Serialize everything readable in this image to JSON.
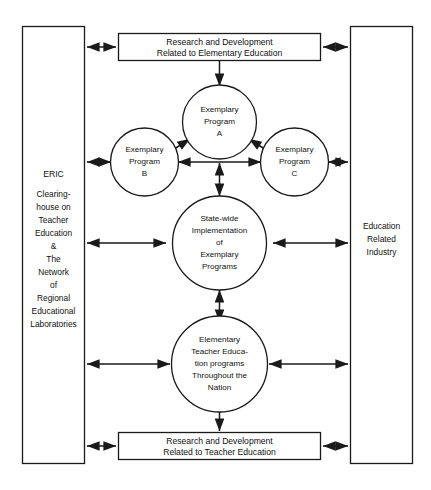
{
  "diagram": {
    "colors": {
      "background": "#ffffff",
      "stroke": "#1a1a1a",
      "text": "#111111",
      "fill": "#ffffff"
    },
    "left_panel": {
      "name": "eric-clearinghouse-panel",
      "lines": [
        "ERIC",
        "",
        "Clearing-",
        "house on",
        "Teacher",
        "Education",
        "&",
        "The",
        "Network",
        "of",
        "Regional",
        "Educational",
        "Laboratories"
      ]
    },
    "right_panel": {
      "name": "education-related-industry-panel",
      "lines": [
        "Education",
        "Related",
        "Industry"
      ]
    },
    "top_box": {
      "name": "research-development-elementary-education",
      "lines": [
        "Research and Development",
        "Related to Elementary Education"
      ]
    },
    "bottom_box": {
      "name": "research-development-teacher-education",
      "lines": [
        "Research and Development",
        "Related to Teacher Education"
      ]
    },
    "circles": [
      {
        "id": "exemplary-program-a",
        "lines": [
          "Exemplary",
          "Program",
          "A"
        ]
      },
      {
        "id": "exemplary-program-b",
        "lines": [
          "Exemplary",
          "Program",
          "B"
        ]
      },
      {
        "id": "exemplary-program-c",
        "lines": [
          "Exemplary",
          "Program",
          "C"
        ]
      },
      {
        "id": "statewide-implementation",
        "lines": [
          "State-wide",
          "Implementation",
          "of",
          "Exemplary",
          "Programs"
        ]
      },
      {
        "id": "elementary-teacher-education",
        "lines": [
          "Elementary",
          "Teacher Educa-",
          "tion programs",
          "Throughout the",
          "Nation"
        ]
      }
    ],
    "connectors": [
      {
        "name": "arrow-left-panel-to-top-box",
        "kind": "double"
      },
      {
        "name": "arrow-top-box-to-right-panel",
        "kind": "double"
      },
      {
        "name": "arrow-top-box-to-program-a",
        "kind": "single-down"
      },
      {
        "name": "arrow-program-a-to-program-b",
        "kind": "double"
      },
      {
        "name": "arrow-program-a-to-program-c",
        "kind": "double"
      },
      {
        "name": "arrow-left-panel-to-program-b",
        "kind": "double"
      },
      {
        "name": "arrow-program-c-to-right-panel",
        "kind": "double"
      },
      {
        "name": "arrow-program-b-to-program-c",
        "kind": "double"
      },
      {
        "name": "arrow-programs-to-statewide",
        "kind": "double"
      },
      {
        "name": "arrow-left-panel-to-statewide",
        "kind": "double"
      },
      {
        "name": "arrow-statewide-to-right-panel",
        "kind": "double"
      },
      {
        "name": "arrow-statewide-to-teacher-education",
        "kind": "double"
      },
      {
        "name": "arrow-left-panel-to-teacher-education",
        "kind": "double"
      },
      {
        "name": "arrow-teacher-education-to-right-panel",
        "kind": "double"
      },
      {
        "name": "arrow-teacher-education-to-bottom-box",
        "kind": "single-down"
      },
      {
        "name": "arrow-left-panel-to-bottom-box",
        "kind": "double"
      },
      {
        "name": "arrow-bottom-box-to-right-panel",
        "kind": "double"
      }
    ]
  }
}
